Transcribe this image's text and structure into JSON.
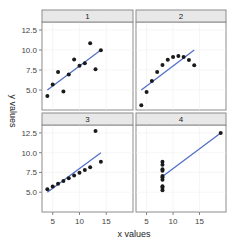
{
  "chart_data": {
    "type": "scatter",
    "title": "",
    "xlabel": "x values",
    "ylabel": "y values",
    "xlim": [
      3,
      20
    ],
    "ylim": [
      2.5,
      13.5
    ],
    "x_ticks": [
      5,
      10,
      15
    ],
    "y_ticks": [
      "5.0",
      "7.5",
      "10.0",
      "12.5"
    ],
    "grid": true,
    "facets": [
      {
        "label": "1",
        "x": [
          10,
          8,
          13,
          9,
          11,
          14,
          6,
          4,
          12,
          7,
          5
        ],
        "y": [
          8.04,
          6.95,
          7.58,
          8.81,
          8.33,
          9.96,
          7.24,
          4.26,
          10.84,
          4.82,
          5.68
        ],
        "fit": {
          "x0": 4,
          "y0": 5.0,
          "x1": 14,
          "y1": 10.0
        }
      },
      {
        "label": "2",
        "x": [
          10,
          8,
          13,
          9,
          11,
          14,
          6,
          4,
          12,
          7,
          5
        ],
        "y": [
          9.14,
          8.14,
          8.74,
          8.77,
          9.26,
          8.1,
          6.13,
          3.1,
          9.13,
          7.26,
          4.74
        ],
        "fit": {
          "x0": 4,
          "y0": 5.0,
          "x1": 14,
          "y1": 10.0
        }
      },
      {
        "label": "3",
        "x": [
          10,
          8,
          13,
          9,
          11,
          14,
          6,
          4,
          12,
          7,
          5
        ],
        "y": [
          7.46,
          6.77,
          12.74,
          7.11,
          7.81,
          8.84,
          6.08,
          5.39,
          8.15,
          6.42,
          5.73
        ],
        "fit": {
          "x0": 4,
          "y0": 5.0,
          "x1": 14,
          "y1": 10.0
        }
      },
      {
        "label": "4",
        "x": [
          8,
          8,
          8,
          8,
          8,
          8,
          8,
          19,
          8,
          8,
          8
        ],
        "y": [
          6.58,
          5.76,
          7.71,
          8.84,
          8.47,
          7.04,
          5.25,
          12.5,
          5.56,
          7.91,
          6.89
        ],
        "fit": {
          "x0": 8,
          "y0": 7.0,
          "x1": 19,
          "y1": 12.5
        }
      }
    ],
    "colors": {
      "point": "#1a1a1a",
      "fit_line": "#5470c6",
      "strip_bg": "#e8e8e8",
      "border": "#8c8c8c"
    }
  }
}
